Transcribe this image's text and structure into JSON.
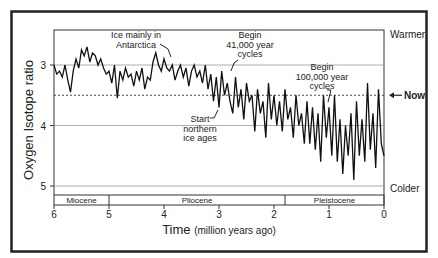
{
  "chart_data": {
    "type": "line",
    "title": "",
    "xlabel": "Time",
    "xlabel_unit": "(million years ago)",
    "ylabel": "Oxygen Isotope ratio",
    "xlim": [
      6,
      0
    ],
    "ylim": [
      2.4,
      5.15
    ],
    "y_inverted": true,
    "x_ticks": [
      "6",
      "5",
      "4",
      "3",
      "2",
      "1",
      "0"
    ],
    "y_ticks": [
      "3",
      "4",
      "5"
    ],
    "gridlines_y": [
      3,
      4,
      5
    ],
    "reference_line": {
      "label": "Now",
      "value": 3.5,
      "style": "dashed"
    },
    "right_labels": {
      "top": "Warmer",
      "bottom": "Colder"
    },
    "epochs": [
      {
        "name": "Miocene",
        "start": 6,
        "end": 5.0
      },
      {
        "name": "Pliocene",
        "start": 5.0,
        "end": 1.8
      },
      {
        "name": "Pleistocene",
        "start": 1.8,
        "end": 0
      }
    ],
    "annotations": [
      {
        "text": [
          "Ice mainly in",
          "Antarctica"
        ],
        "x": 3.3,
        "y": 2.9
      },
      {
        "text": [
          "Begin",
          "41,000 year",
          "cycles"
        ],
        "x": 2.9,
        "y": 3.0
      },
      {
        "text": [
          "Start",
          "northern",
          "ice ages"
        ],
        "x": 2.8,
        "y": 3.8
      },
      {
        "text": [
          "Begin",
          "100,000 year",
          "cycles"
        ],
        "x": 0.9,
        "y": 3.5
      }
    ],
    "series": [
      {
        "name": "Oxygen isotope ratio",
        "x": [
          6.0,
          5.95,
          5.9,
          5.85,
          5.8,
          5.75,
          5.7,
          5.65,
          5.6,
          5.55,
          5.5,
          5.45,
          5.4,
          5.35,
          5.3,
          5.25,
          5.2,
          5.15,
          5.1,
          5.05,
          5.0,
          4.95,
          4.9,
          4.85,
          4.8,
          4.75,
          4.7,
          4.65,
          4.6,
          4.55,
          4.5,
          4.45,
          4.4,
          4.35,
          4.3,
          4.25,
          4.2,
          4.15,
          4.1,
          4.05,
          4.0,
          3.95,
          3.9,
          3.85,
          3.8,
          3.75,
          3.7,
          3.65,
          3.6,
          3.55,
          3.5,
          3.45,
          3.4,
          3.35,
          3.3,
          3.25,
          3.2,
          3.15,
          3.1,
          3.05,
          3.0,
          2.95,
          2.9,
          2.85,
          2.8,
          2.75,
          2.7,
          2.65,
          2.6,
          2.55,
          2.5,
          2.45,
          2.4,
          2.35,
          2.3,
          2.25,
          2.2,
          2.15,
          2.1,
          2.05,
          2.0,
          1.95,
          1.9,
          1.85,
          1.8,
          1.75,
          1.7,
          1.65,
          1.6,
          1.55,
          1.5,
          1.45,
          1.4,
          1.35,
          1.3,
          1.25,
          1.2,
          1.15,
          1.1,
          1.05,
          1.0,
          0.95,
          0.9,
          0.85,
          0.8,
          0.75,
          0.7,
          0.65,
          0.6,
          0.55,
          0.5,
          0.45,
          0.4,
          0.35,
          0.3,
          0.25,
          0.2,
          0.15,
          0.1,
          0.05,
          0.0
        ],
        "values": [
          3.0,
          3.15,
          3.1,
          3.2,
          3.0,
          3.25,
          3.45,
          3.1,
          2.9,
          3.05,
          2.75,
          2.85,
          2.7,
          2.95,
          2.8,
          2.85,
          3.0,
          2.9,
          3.05,
          3.15,
          3.1,
          3.3,
          3.0,
          3.55,
          3.1,
          3.25,
          3.05,
          3.2,
          3.15,
          3.35,
          3.1,
          3.25,
          3.05,
          3.4,
          3.2,
          3.25,
          2.95,
          2.8,
          3.0,
          3.1,
          2.9,
          3.05,
          3.1,
          3.0,
          3.25,
          3.1,
          3.0,
          3.2,
          3.05,
          3.35,
          3.1,
          3.0,
          3.2,
          3.1,
          3.3,
          3.0,
          3.4,
          3.15,
          3.6,
          3.2,
          3.7,
          3.1,
          3.5,
          3.3,
          3.6,
          3.8,
          3.2,
          3.7,
          3.4,
          3.9,
          3.3,
          3.6,
          3.5,
          4.1,
          3.4,
          3.8,
          3.6,
          4.2,
          3.3,
          3.9,
          3.5,
          4.0,
          3.6,
          4.1,
          3.4,
          3.9,
          3.7,
          4.2,
          3.5,
          4.0,
          3.8,
          4.3,
          3.6,
          4.3,
          3.7,
          4.4,
          3.8,
          4.6,
          3.5,
          4.2,
          3.7,
          4.5,
          3.5,
          4.6,
          3.9,
          4.8,
          4.0,
          4.5,
          3.8,
          4.9,
          3.6,
          4.5,
          3.9,
          4.6,
          3.3,
          4.4,
          3.8,
          4.7,
          3.4,
          4.3,
          4.5
        ]
      }
    ]
  }
}
